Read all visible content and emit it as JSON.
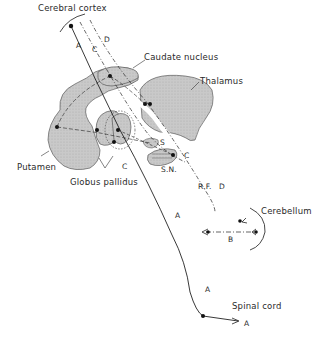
{
  "diagram": {
    "structures": {
      "cerebral_cortex": "Cerebral cortex",
      "caudate_nucleus": "Caudate nucleus",
      "thalamus": "Thalamus",
      "putamen": "Putamen",
      "globus_pallidus": "Globus pallidus",
      "substantia_nigra": "S.N.",
      "subthalamic": "S",
      "reticular_formation": "R.F.",
      "cerebellum": "Cerebellum",
      "spinal_cord": "Spinal cord"
    },
    "pathway_labels": {
      "a1": "A",
      "a2": "A",
      "a3": "A",
      "a4": "A",
      "b": "B",
      "c1": "C",
      "c2": "C",
      "c3": "C",
      "d1": "D",
      "d2": "D"
    },
    "colors": {
      "fill": "#c8c8c8",
      "stroke": "#333333",
      "background": "#ffffff"
    }
  }
}
